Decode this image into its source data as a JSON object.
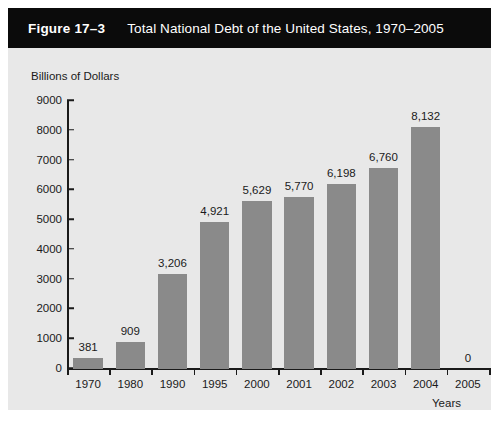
{
  "figure": {
    "number": "Figure 17–3",
    "title": "Total National Debt of the United States, 1970–2005",
    "banner_color": "#0b0b0b",
    "banner_text_color": "#ffffff",
    "panel_color": "#e8e8e8",
    "page_color": "#ffffff"
  },
  "chart_data": {
    "type": "bar",
    "title": "Total National Debt of the United States, 1970–2005",
    "xlabel": "Years",
    "ylabel": "Billions of Dollars",
    "categories": [
      "1970",
      "1980",
      "1990",
      "1995",
      "2000",
      "2001",
      "2002",
      "2003",
      "2004",
      "2005"
    ],
    "values": [
      381,
      909,
      3206,
      4921,
      5629,
      5770,
      6198,
      6760,
      8132,
      0
    ],
    "value_labels": [
      "381",
      "909",
      "3,206",
      "4,921",
      "5,629",
      "5,770",
      "6,198",
      "6,760",
      "8,132",
      "0"
    ],
    "ylim": [
      0,
      9000
    ],
    "ytick_labels": [
      "9000",
      "8000",
      "7000",
      "6000",
      "5000",
      "4000",
      "3000",
      "2000",
      "1000",
      "0"
    ],
    "ytick_values": [
      9000,
      8000,
      7000,
      6000,
      5000,
      4000,
      3000,
      2000,
      1000,
      0
    ],
    "grid": false,
    "legend": false,
    "bar_color": "#8a8a8a",
    "axis_color": "#1a1a1a"
  }
}
